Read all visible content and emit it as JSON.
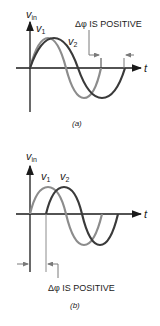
{
  "figure_a": {
    "y_axis_label": "v",
    "y_axis_sub": "in",
    "x_axis_label": "t",
    "curve1_label": "v",
    "curve1_sub": "1",
    "curve2_label": "v",
    "curve2_sub": "2",
    "annotation": "Δφ IS POSITIVE",
    "caption": "(a)"
  },
  "figure_b": {
    "y_axis_label": "v",
    "y_axis_sub": "in",
    "x_axis_label": "t",
    "curve1_label": "v",
    "curve1_sub": "1",
    "curve2_label": "v",
    "curve2_sub": "2",
    "annotation": "Δφ IS POSITIVE",
    "caption": "(b)"
  },
  "colors": {
    "axis": "#1a1a1a",
    "v1": "#8c8c8c",
    "v2": "#3a3a3a",
    "marker": "#7a7a7a"
  }
}
